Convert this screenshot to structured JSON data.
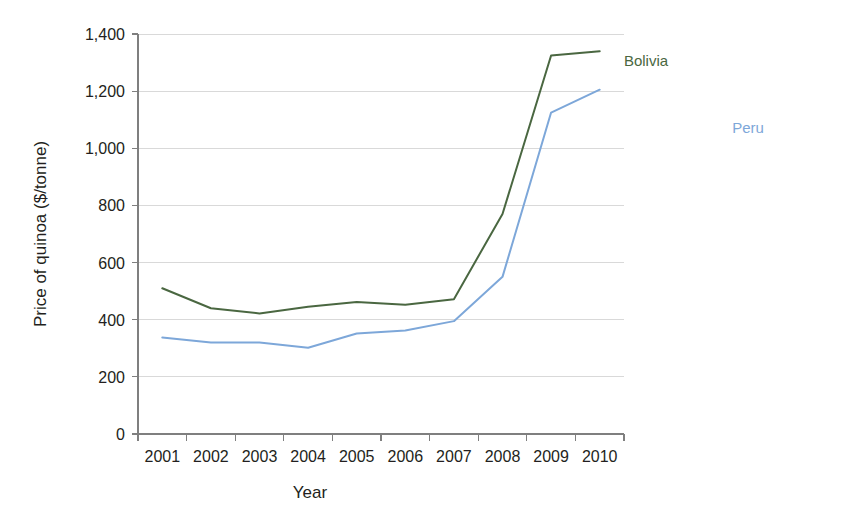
{
  "chart_data": {
    "type": "line",
    "title": "",
    "xlabel": "Year",
    "ylabel": "Price of quinoa ($/tonne)",
    "categories": [
      "2001",
      "2002",
      "2003",
      "2004",
      "2005",
      "2006",
      "2007",
      "2008",
      "2009",
      "2010"
    ],
    "x_tick_labels": [
      "2001",
      "2002",
      "2003",
      "2004",
      "2005",
      "2006",
      "2007",
      "2008",
      "2009",
      "2010"
    ],
    "y_tick_labels": [
      "0",
      "200",
      "400",
      "600",
      "800",
      "1,000",
      "1,200",
      "1,400"
    ],
    "y_tick_values": [
      0,
      200,
      400,
      600,
      800,
      1000,
      1200,
      1400
    ],
    "ylim": [
      0,
      1400
    ],
    "grid": true,
    "legend_position": "inline-labels",
    "series": [
      {
        "name": "Bolivia",
        "color": "#4a6741",
        "label_text": "Bolivia",
        "values": [
          510,
          440,
          422,
          445,
          462,
          452,
          472,
          770,
          1325,
          1340
        ]
      },
      {
        "name": "Peru",
        "color": "#7da7d9",
        "label_text": "Peru",
        "values": [
          338,
          320,
          320,
          302,
          352,
          362,
          395,
          550,
          1125,
          1205
        ]
      }
    ],
    "annotations": [
      {
        "text": "Bolivia",
        "series": "Bolivia",
        "color": "#4a6741"
      },
      {
        "text": "Peru",
        "series": "Peru",
        "color": "#7da7d9"
      }
    ]
  },
  "colors": {
    "bolivia": "#4a6741",
    "peru": "#7da7d9",
    "grid": "#d9d9d9",
    "axis": "#7f7f7f",
    "text": "#231f20",
    "background": "#ffffff"
  }
}
